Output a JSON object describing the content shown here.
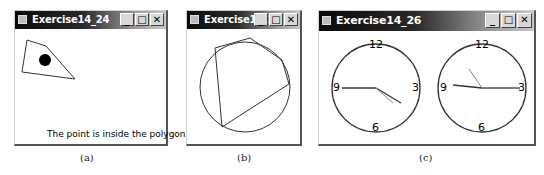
{
  "windows": [
    {
      "title": "Exercise14_24",
      "caption": "(a)",
      "status_text": "The point is inside the polygon",
      "polygon": "27,40 46,46 75,79 22,72",
      "point": {
        "cx": 45,
        "cy": 60,
        "r": 6
      }
    },
    {
      "title": "Exercise14_25",
      "caption": "(b)",
      "circle": {
        "cx": 245,
        "cy": 87,
        "r": 45
      },
      "polygon": "215,48 250,38 282,60 289,84 222,127"
    },
    {
      "title": "Exercise14_26",
      "caption": "(c)",
      "clocks": [
        {
          "numbers": [
            "12",
            "3",
            "6",
            "9"
          ]
        },
        {
          "numbers": [
            "12",
            "3",
            "6",
            "9"
          ]
        }
      ]
    }
  ],
  "titlebar_buttons": {
    "minimize": "_",
    "maximize": "□",
    "close": "✕"
  }
}
